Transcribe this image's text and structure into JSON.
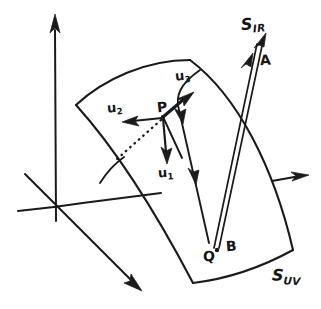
{
  "figure": {
    "type": "hand-drawn-geometry-diagram",
    "ink_color": "#1a1a1a",
    "background_color": "#ffffff",
    "width": 321,
    "height": 309
  },
  "labels": {
    "point_p": "P",
    "point_a": "A",
    "point_b": "B",
    "point_q": "Q",
    "vector_u1_base": "u",
    "vector_u1_sub": "1",
    "vector_u2_base": "u",
    "vector_u2_sub": "2",
    "vector_u3_base": "u",
    "vector_u3_sub": "3",
    "surface_ir_base": "S",
    "surface_ir_sub": "IR",
    "surface_uv_base": "S",
    "surface_uv_sub": "UV"
  },
  "geometry": {
    "axes": {
      "origin": [
        54,
        207
      ],
      "vertical_axis": {
        "from": [
          55,
          220
        ],
        "to": [
          55,
          16
        ],
        "arrow": true
      },
      "horizontal_axis_left": {
        "from": [
          18,
          210
        ],
        "to": [
          54,
          207
        ]
      },
      "horizontal_axis_right": {
        "from": [
          54,
          207
        ],
        "to": [
          160,
          193
        ]
      },
      "horizontal_axis_emerging": {
        "from": [
          272,
          180
        ],
        "to": [
          307,
          175
        ],
        "arrow": true
      },
      "depth_axis": {
        "from": [
          25,
          174
        ],
        "to": [
          140,
          289
        ],
        "arrow": true
      }
    },
    "surface_patch": {
      "corner_top_left": [
        76,
        105
      ],
      "corner_top_right": [
        190,
        60
      ],
      "corner_bottom_right": [
        293,
        250
      ],
      "corner_bottom_left": [
        193,
        283
      ]
    },
    "tangent_frame_origin": [
      163,
      117
    ],
    "vector_u1_tip": [
      167,
      162
    ],
    "vector_u2_tip": [
      124,
      121
    ],
    "vector_u3_tip": [
      192,
      94
    ],
    "dotted_normal_tip": [
      117,
      159
    ],
    "ray_incident_tip": [
      266,
      38
    ],
    "ray_point_q": [
      215,
      250
    ],
    "flow_curve_arrow_1": [
      185,
      112
    ],
    "flow_curve_arrow_2": [
      196,
      176
    ]
  }
}
